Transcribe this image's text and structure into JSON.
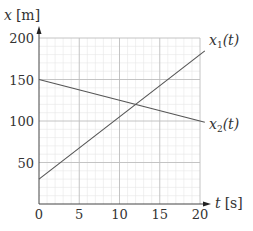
{
  "chart_data": {
    "type": "line",
    "title": "",
    "xlabel": "t [s]",
    "ylabel": "x [m]",
    "xlim": [
      0,
      20
    ],
    "ylim": [
      0,
      200
    ],
    "x_ticks": [
      "0",
      "5",
      "10",
      "15",
      "20"
    ],
    "y_ticks": [
      "50",
      "100",
      "150",
      "200"
    ],
    "grid": true,
    "minor_grid": true,
    "legend_position": "inline-right",
    "series": [
      {
        "name": "x1(t)",
        "label_main": "x",
        "label_sub": "1",
        "label_arg": "(t)",
        "x": [
          0,
          20.6
        ],
        "y": [
          30,
          184.5
        ],
        "equation": "x1 = 30 + 7.5 t",
        "color": "#555555"
      },
      {
        "name": "x2(t)",
        "label_main": "x",
        "label_sub": "2",
        "label_arg": "(t)",
        "x": [
          0,
          20.6
        ],
        "y": [
          150,
          98.5
        ],
        "equation": "x2 = 150 - 2.5 t",
        "color": "#555555"
      }
    ],
    "intersection": {
      "t": 12,
      "x": 120
    }
  },
  "axes": {
    "y_label_var": "x",
    "y_label_unit": "[m]",
    "x_label_var": "t",
    "x_label_unit": "[s]",
    "origin_label": "0"
  },
  "colors": {
    "major_grid": "#bdbdbd",
    "minor_grid": "#e6e6e6",
    "axis": "#444444",
    "line": "#555555",
    "text": "#333333"
  }
}
